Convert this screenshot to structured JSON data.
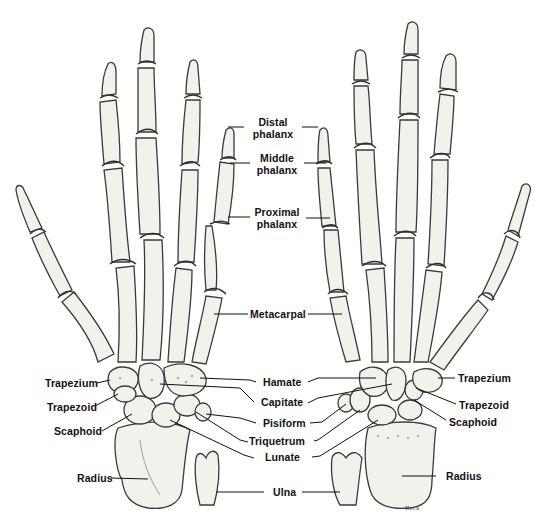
{
  "figure": {
    "signature": "Beck"
  },
  "labels": {
    "distal_phalanx": [
      "Distal",
      "phalanx"
    ],
    "middle_phalanx": [
      "Middle",
      "phalanx"
    ],
    "proximal_phalanx": [
      "Proximal",
      "phalanx"
    ],
    "metacarpal": "Metacarpal",
    "hamate": "Hamate",
    "capitate": "Capitate",
    "pisiform": "Pisiform",
    "triquetrum": "Triquetrum",
    "lunate": "Lunate",
    "ulna": "Ulna",
    "left": {
      "trapezium": "Trapezium",
      "trapezoid": "Trapezoid",
      "scaphoid": "Scaphoid",
      "radius": "Radius"
    },
    "right": {
      "trapezium": "Trapezium",
      "trapezoid": "Trapezoid",
      "scaphoid": "Scaphoid",
      "radius": "Radius"
    }
  },
  "colors": {
    "bone_fill": "#f3f1ec",
    "bone_outline": "#3a3a3a",
    "label_text": "#111111",
    "background": "#ffffff"
  }
}
